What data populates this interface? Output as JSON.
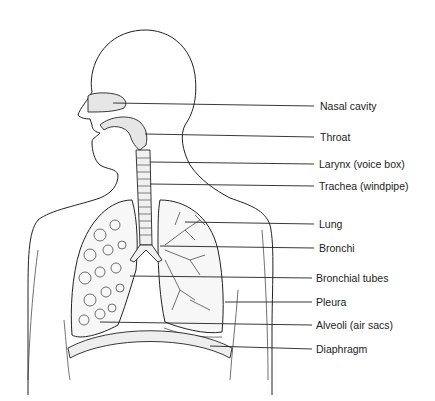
{
  "diagram": {
    "labels": [
      {
        "id": "nasal-cavity",
        "text": "Nasal cavity",
        "x": 320,
        "y": 100,
        "line_from": [
          113,
          103
        ]
      },
      {
        "id": "throat",
        "text": "Throat",
        "x": 320,
        "y": 130,
        "line_from": [
          145,
          134
        ]
      },
      {
        "id": "larynx",
        "text": "Larynx (voice box)",
        "x": 319,
        "y": 157,
        "line_from": [
          150,
          162
        ]
      },
      {
        "id": "trachea",
        "text": "Trachea (windpipe)",
        "x": 319,
        "y": 178,
        "line_from": [
          150,
          184
        ]
      },
      {
        "id": "lung",
        "text": "Lung",
        "x": 319,
        "y": 217,
        "line_from": [
          185,
          222
        ]
      },
      {
        "id": "bronchi",
        "text": "Bronchi",
        "x": 319,
        "y": 241,
        "line_from": [
          160,
          246
        ]
      },
      {
        "id": "bronchial-tubes",
        "text": "Bronchial tubes",
        "x": 316,
        "y": 270,
        "line_from": [
          130,
          276
        ]
      },
      {
        "id": "pleura",
        "text": "Pleura",
        "x": 316,
        "y": 293,
        "line_from": [
          225,
          302
        ]
      },
      {
        "id": "alveoli",
        "text": "Alveoli (air sacs)",
        "x": 316,
        "y": 316,
        "line_from": [
          100,
          322
        ]
      },
      {
        "id": "diaphragm",
        "text": "Diaphragm",
        "x": 316,
        "y": 340,
        "line_from": [
          210,
          346
        ]
      }
    ]
  }
}
